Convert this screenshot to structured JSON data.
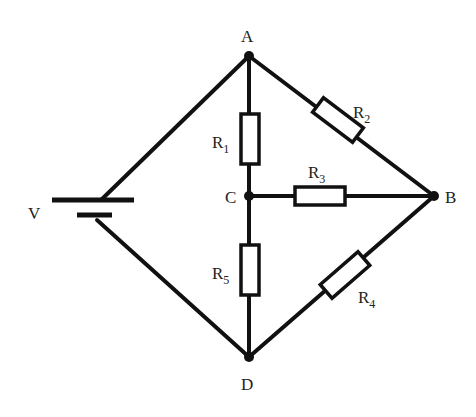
{
  "diagram": {
    "type": "circuit",
    "nodes": {
      "A": {
        "label": "A"
      },
      "B": {
        "label": "B"
      },
      "C": {
        "label": "C"
      },
      "D": {
        "label": "D"
      }
    },
    "source": {
      "label": "V",
      "between": [
        "A",
        "D"
      ]
    },
    "resistors": [
      {
        "name": "R1",
        "main": "R",
        "sub": "1",
        "between": [
          "A",
          "C"
        ]
      },
      {
        "name": "R2",
        "main": "R",
        "sub": "2",
        "between": [
          "A",
          "B"
        ]
      },
      {
        "name": "R3",
        "main": "R",
        "sub": "3",
        "between": [
          "C",
          "B"
        ]
      },
      {
        "name": "R4",
        "main": "R",
        "sub": "4",
        "between": [
          "D",
          "B"
        ]
      },
      {
        "name": "R5",
        "main": "R",
        "sub": "5",
        "between": [
          "C",
          "D"
        ]
      }
    ]
  }
}
